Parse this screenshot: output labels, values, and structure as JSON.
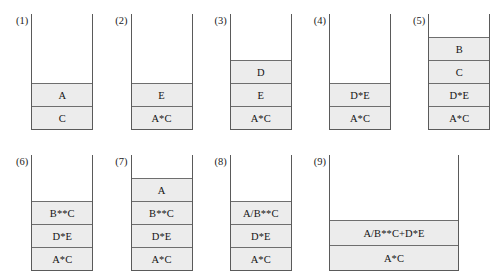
{
  "figure": {
    "cell_fill_color": "#ececec",
    "cell_border_color": "#6e6e6e",
    "stack_border_color": "#5a5a5a"
  },
  "chart_data": {
    "type": "diagram",
    "title": "",
    "subtitle": "",
    "xlabel": "",
    "ylabel": "",
    "legend": [],
    "note": "Nine stack snapshots; each stack is an open-top container whose cells are listed bottom-to-top.",
    "panels": [
      {
        "label": "(1)",
        "width": "normal",
        "cells_bottom_to_top": [
          "C",
          "A"
        ]
      },
      {
        "label": "(2)",
        "width": "normal",
        "cells_bottom_to_top": [
          "A*C",
          "E"
        ]
      },
      {
        "label": "(3)",
        "width": "normal",
        "cells_bottom_to_top": [
          "A*C",
          "E",
          "D"
        ]
      },
      {
        "label": "(4)",
        "width": "normal",
        "cells_bottom_to_top": [
          "A*C",
          "D*E"
        ]
      },
      {
        "label": "(5)",
        "width": "normal",
        "cells_bottom_to_top": [
          "A*C",
          "D*E",
          "C",
          "B"
        ]
      },
      {
        "label": "(6)",
        "width": "normal",
        "cells_bottom_to_top": [
          "A*C",
          "D*E",
          "B**C"
        ]
      },
      {
        "label": "(7)",
        "width": "normal",
        "cells_bottom_to_top": [
          "A*C",
          "D*E",
          "B**C",
          "A"
        ]
      },
      {
        "label": "(8)",
        "width": "normal",
        "cells_bottom_to_top": [
          "A*C",
          "D*E",
          "A/B**C"
        ]
      },
      {
        "label": "(9)",
        "width": "wide",
        "cells_bottom_to_top": [
          "A*C",
          "A/B**C+D*E"
        ]
      }
    ]
  },
  "panels": {
    "p1": {
      "label": "(1)",
      "cells": {
        "c0": "A",
        "c1": "C"
      }
    },
    "p2": {
      "label": "(2)",
      "cells": {
        "c0": "E",
        "c1": "A*C"
      }
    },
    "p3": {
      "label": "(3)",
      "cells": {
        "c0": "D",
        "c1": "E",
        "c2": "A*C"
      }
    },
    "p4": {
      "label": "(4)",
      "cells": {
        "c0": "D*E",
        "c1": "A*C"
      }
    },
    "p5": {
      "label": "(5)",
      "cells": {
        "c0": "B",
        "c1": "C",
        "c2": "D*E",
        "c3": "A*C"
      }
    },
    "p6": {
      "label": "(6)",
      "cells": {
        "c0": "B**C",
        "c1": "D*E",
        "c2": "A*C"
      }
    },
    "p7": {
      "label": "(7)",
      "cells": {
        "c0": "A",
        "c1": "B**C",
        "c2": "D*E",
        "c3": "A*C"
      }
    },
    "p8": {
      "label": "(8)",
      "cells": {
        "c0": "A/B**C",
        "c1": "D*E",
        "c2": "A*C"
      }
    },
    "p9": {
      "label": "(9)",
      "cells": {
        "c0": "A/B**C+D*E",
        "c1": "A*C"
      }
    }
  }
}
